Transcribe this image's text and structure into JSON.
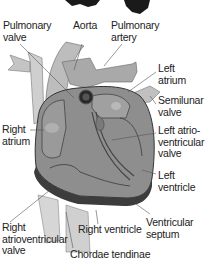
{
  "diagram": {
    "type": "anatomy",
    "labels": [
      {
        "id": "pulmonary-valve",
        "text": "Pulmonary\nvalve",
        "x": 3,
        "y": 20
      },
      {
        "id": "aorta",
        "text": "Aorta",
        "x": 73,
        "y": 20
      },
      {
        "id": "pulmonary-artery",
        "text": "Pulmonary\nartery",
        "x": 111,
        "y": 20
      },
      {
        "id": "left-atrium",
        "text": "Left\natrium",
        "x": 158,
        "y": 63
      },
      {
        "id": "semilunar-valve",
        "text": "Semilunar\nvalve",
        "x": 158,
        "y": 95
      },
      {
        "id": "right-atrium",
        "text": "Right\natrium",
        "x": 2,
        "y": 124
      },
      {
        "id": "left-atrioventricular-valve",
        "text": "Left atrio-\nventricular\nvalve",
        "x": 158,
        "y": 125
      },
      {
        "id": "left-ventricle",
        "text": "Left\nventricle",
        "x": 158,
        "y": 170
      },
      {
        "id": "right-ventricle",
        "text": "Right ventricle",
        "x": 78,
        "y": 224
      },
      {
        "id": "ventricular-septum",
        "text": "Ventricular\nseptum",
        "x": 146,
        "y": 217
      },
      {
        "id": "right-atrioventricular-valve",
        "text": "Right\natrioventricular\nvalve",
        "x": 2,
        "y": 222
      },
      {
        "id": "chordae-tendinae",
        "text": "Chordae tendinae",
        "x": 70,
        "y": 249
      }
    ]
  },
  "colors": {
    "heart_fill": "#8e8e8e",
    "heart_light": "#b5b5b5",
    "heart_dark": "#3c3c3c",
    "vessel": "#c8c8c8",
    "text": "#222222",
    "leader": "#555555"
  }
}
